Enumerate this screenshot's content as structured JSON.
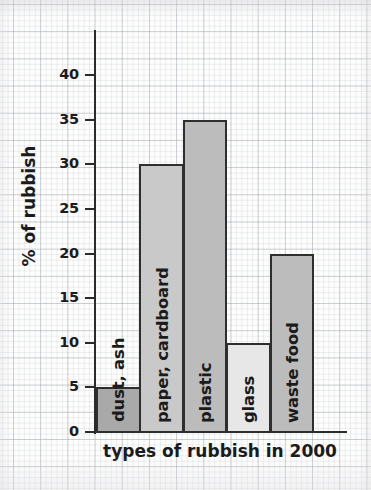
{
  "chart_data": {
    "type": "bar",
    "title": "",
    "xlabel": "types of rubbish in 2000",
    "ylabel": "% of rubbish",
    "categories": [
      "dust, ash",
      "paper, cardboard",
      "plastic",
      "glass",
      "waste food"
    ],
    "values": [
      5,
      30,
      35,
      10,
      20
    ],
    "ylim": [
      0,
      40
    ],
    "yticks": [
      0,
      5,
      10,
      15,
      20,
      25,
      30,
      35,
      40
    ],
    "ytick_labels": [
      "0",
      "5",
      "10",
      "15",
      "20",
      "25",
      "30",
      "35",
      "40"
    ],
    "grid": true,
    "legend": "none",
    "bar_colors": [
      "#a9a9a9",
      "#c9c9c9",
      "#bcbcbc",
      "#e7e7e7",
      "#bcbcbc"
    ],
    "bar_edge_color": "#2e2e2e",
    "bars": [
      {
        "label": "dust, ash",
        "value": 5,
        "color": "#a9a9a9",
        "label_fits_inside": false
      },
      {
        "label": "paper, cardboard",
        "value": 30,
        "color": "#c9c9c9",
        "label_fits_inside": true
      },
      {
        "label": "plastic",
        "value": 35,
        "color": "#bcbcbc",
        "label_fits_inside": true
      },
      {
        "label": "glass",
        "value": 10,
        "color": "#e7e7e7",
        "label_fits_inside": true
      },
      {
        "label": "waste food",
        "value": 20,
        "color": "#bcbcbc",
        "label_fits_inside": true
      }
    ]
  },
  "axes": {
    "y_title": "% of rubbish",
    "x_title": "types of rubbish in 2000"
  },
  "colors": {
    "axis": "#2b2b2b",
    "text": "#1b1b1b",
    "paper": "#fdfdfc",
    "grid_major": "#969baa",
    "grid_minor": "#aab2c3"
  }
}
